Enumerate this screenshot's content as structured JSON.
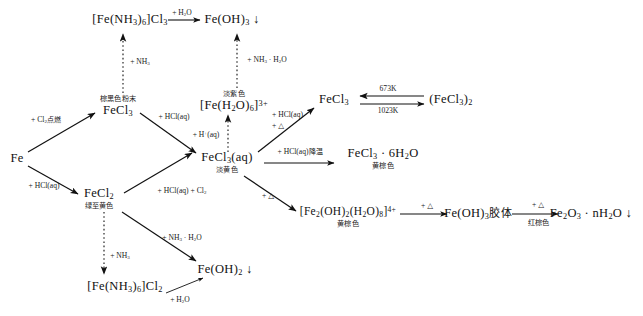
{
  "diagram": {
    "nodes": [
      {
        "id": "fe_nh3_6_cl3",
        "formula": "[Fe(NH₃)₆]Cl₃",
        "color_label": "",
        "x": 130,
        "y": 20
      },
      {
        "id": "fe_oh_3",
        "formula": "Fe(OH)₃ ↓",
        "color_label": "",
        "x": 232,
        "y": 20
      },
      {
        "id": "fecl3_solid",
        "formula": "FeCl₃",
        "color_label": "棕黑色粉末",
        "x": 118,
        "y": 107
      },
      {
        "id": "fe_h2o_6_3plus",
        "formula": "[Fe(H₂O)₆]³⁺",
        "color_label": "淡紫色",
        "x": 234,
        "y": 102
      },
      {
        "id": "fecl3_right",
        "formula": "FeCl₃",
        "color_label": "",
        "x": 334,
        "y": 100
      },
      {
        "id": "fecl3_dimer",
        "formula": "(FeCl₃)₂",
        "color_label": "",
        "x": 451,
        "y": 100
      },
      {
        "id": "fe_metal",
        "formula": "Fe",
        "color_label": "",
        "x": 17,
        "y": 159
      },
      {
        "id": "fecl3_aq",
        "formula": "FeCl₃(aq)",
        "color_label": "淡黄色",
        "x": 227,
        "y": 163
      },
      {
        "id": "fecl3_6h2o",
        "formula": "FeCl₃ · 6H₂O",
        "color_label": "黄棕色",
        "x": 383,
        "y": 159
      },
      {
        "id": "fecl2",
        "formula": "FeCl₂",
        "color_label": "绿至黄色",
        "x": 99,
        "y": 199
      },
      {
        "id": "fe2_oh2_h2o8",
        "formula": "[Fe₂(OH)₂(H₂O)₈]⁴⁺",
        "color_label": "黄棕色",
        "x": 348,
        "y": 216
      },
      {
        "id": "fe_oh_3_colloid",
        "formula": "Fe(OH)₃胶体",
        "color_label": "",
        "x": 478,
        "y": 214
      },
      {
        "id": "fe2o3_nh2o",
        "formula": "Fe₂O₃ · nH₂O ↓",
        "color_label": "",
        "x": 591,
        "y": 214
      },
      {
        "id": "fe_oh_2",
        "formula": "Fe(OH)₂ ↓",
        "color_label": "",
        "x": 225,
        "y": 270
      },
      {
        "id": "fe_nh3_6_cl2",
        "formula": "[Fe(NH₃)₆]Cl₂",
        "color_label": "",
        "x": 125,
        "y": 287
      }
    ],
    "edge_labels": [
      {
        "id": "top_h2o",
        "text": "+ H₂O",
        "x": 182,
        "y": 13
      },
      {
        "id": "nh3_to_complex3",
        "text": "+ NH₃",
        "x": 138,
        "y": 62
      },
      {
        "id": "nh3_h2o_to_feoh3",
        "text": "+ NH₃ · H₂O",
        "x": 265,
        "y": 60
      },
      {
        "id": "cl2_ignite",
        "text": "+ Cl₂点燃",
        "x": 46,
        "y": 120
      },
      {
        "id": "hcl_aq_fecl3",
        "text": "+ HCl(aq)",
        "x": 172,
        "y": 117
      },
      {
        "id": "h_plus_aq",
        "text": "+ H⁺(aq)",
        "x": 206,
        "y": 135
      },
      {
        "id": "hcl_aq_delta",
        "text": "+ HCl(aq)\n+ △",
        "x": 290,
        "y": 120
      },
      {
        "id": "temp_673",
        "text": "673K",
        "x": 388,
        "y": 89
      },
      {
        "id": "temp_1023",
        "text": "1023K",
        "x": 388,
        "y": 111
      },
      {
        "id": "hcl_aq_cool",
        "text": "+ HCl(aq)降温",
        "x": 300,
        "y": 152
      },
      {
        "id": "hcl_aq_fe",
        "text": "+ HCl(aq)",
        "x": 44,
        "y": 186
      },
      {
        "id": "hcl_aq_cl2",
        "text": "+ HCl(aq) + Cl₂",
        "x": 180,
        "y": 191
      },
      {
        "id": "delta_hydrolysis",
        "text": "+ △",
        "x": 268,
        "y": 196
      },
      {
        "id": "nh3_to_complex2",
        "text": "+ NH₃",
        "x": 118,
        "y": 256
      },
      {
        "id": "nh3_h2o_to_feoh2",
        "text": "+ NH₃ · H₂O",
        "x": 180,
        "y": 238
      },
      {
        "id": "bottom_h2o",
        "text": "+ H₂O",
        "x": 178,
        "y": 300
      },
      {
        "id": "delta_colloid",
        "text": "+ △",
        "x": 427,
        "y": 207
      },
      {
        "id": "delta_oxide",
        "text": "+ △",
        "x": 538,
        "y": 206
      },
      {
        "id": "colloid_color",
        "text": "红棕色",
        "x": 538,
        "y": 222
      }
    ]
  }
}
